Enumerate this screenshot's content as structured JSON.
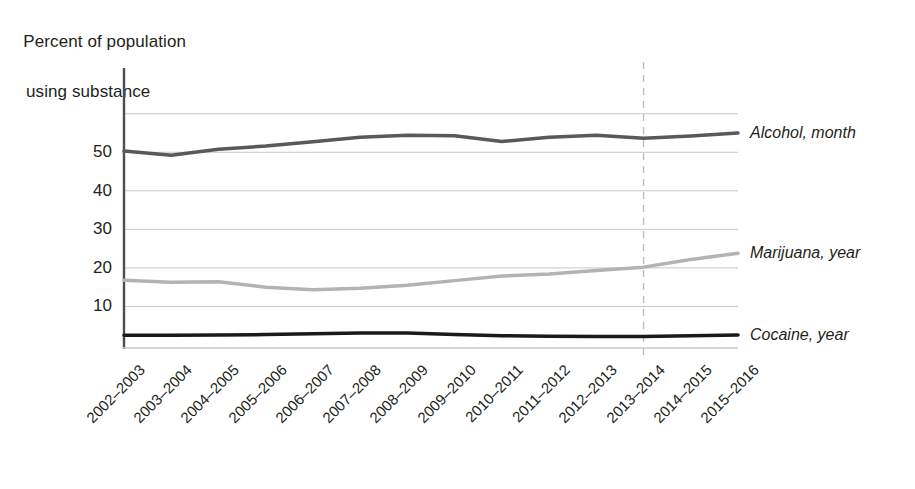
{
  "chart_data": {
    "type": "line",
    "title": "",
    "ylabel": "Percent of population using substance",
    "ylabel_line1": "Percent of population",
    "ylabel_line2": "using substance",
    "xlabel": "",
    "ylim": [
      0,
      62
    ],
    "yticks": [
      10,
      20,
      30,
      40,
      50
    ],
    "ytick_labels": [
      "10",
      "20",
      "30",
      "40",
      "50"
    ],
    "gridlines": [
      10,
      20,
      30,
      40,
      50,
      60
    ],
    "grid": true,
    "legend_position": "right-inline",
    "annotations": [
      {
        "name": "vertical-dashed-marker",
        "x_category": "2013–2014",
        "style": "dashed",
        "color": "#bfbfbf"
      }
    ],
    "categories": [
      "2002–2003",
      "2003–2004",
      "2004–2005",
      "2005–2006",
      "2006–2007",
      "2007–2008",
      "2008–2009",
      "2009–2010",
      "2010–2011",
      "2011–2012",
      "2012–2013",
      "2013–2014",
      "2014–2015",
      "2015–2016"
    ],
    "series": [
      {
        "name": "Alcohol, month",
        "label": "Alcohol, month",
        "color": "#595959",
        "width": 3.5,
        "values": [
          50.3,
          49.2,
          50.8,
          51.6,
          52.7,
          53.9,
          54.4,
          54.3,
          52.8,
          53.9,
          54.4,
          53.6,
          54.2,
          55.0
        ]
      },
      {
        "name": "Marijuana, year",
        "label": "Marijuana, year",
        "color": "#b3b3b3",
        "width": 3.5,
        "values": [
          16.8,
          16.3,
          16.4,
          15.0,
          14.3,
          14.7,
          15.5,
          16.7,
          17.9,
          18.4,
          19.3,
          20.2,
          22.2,
          23.8
        ]
      },
      {
        "name": "Cocaine, year",
        "label": "Cocaine, year",
        "color": "#1a1a1a",
        "width": 3.5,
        "values": [
          2.5,
          2.5,
          2.6,
          2.7,
          2.9,
          3.1,
          3.1,
          2.7,
          2.4,
          2.3,
          2.2,
          2.2,
          2.4,
          2.6
        ]
      }
    ],
    "end_values_rendered_at_right_edge": true
  },
  "colors": {
    "axis": "#4d4d4d",
    "grid": "#c8c8c8",
    "text": "#231f20",
    "marker": "#c0c0c0"
  }
}
